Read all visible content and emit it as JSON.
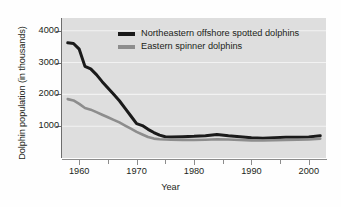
{
  "chart_data": {
    "type": "line",
    "title": "",
    "xlabel": "Year",
    "ylabel": "Dolphin population (in thousands)",
    "xlim": [
      1957,
      2003
    ],
    "ylim": [
      0,
      4400
    ],
    "grid": "horizontal-white",
    "legend_position": "inside-top-center",
    "y_ticks": [
      1000,
      2000,
      3000,
      4000
    ],
    "y_tick_labels": [
      "1000",
      "2000",
      "3000",
      "4000"
    ],
    "x_ticks": [
      1960,
      1970,
      1980,
      1990,
      2000
    ],
    "x_tick_labels": [
      "1960",
      "1970",
      "1980",
      "1990",
      "2000"
    ],
    "x_minor_ticks": [
      1965,
      1975,
      1985,
      1995
    ],
    "x": [
      1958,
      1959,
      1960,
      1961,
      1962,
      1963,
      1964,
      1965,
      1966,
      1967,
      1968,
      1969,
      1970,
      1971,
      1972,
      1973,
      1974,
      1975,
      1976,
      1978,
      1980,
      1982,
      1984,
      1986,
      1988,
      1990,
      1992,
      1994,
      1996,
      1998,
      2000,
      2002
    ],
    "series": [
      {
        "name": "Northeastern offshore spotted dolphins",
        "color": "#1a1a1a",
        "values": [
          3620,
          3600,
          3420,
          2880,
          2800,
          2620,
          2400,
          2200,
          2000,
          1800,
          1560,
          1320,
          1080,
          1020,
          900,
          800,
          720,
          670,
          660,
          670,
          680,
          700,
          740,
          700,
          670,
          640,
          620,
          640,
          650,
          650,
          660,
          700
        ]
      },
      {
        "name": "Eastern spinner dolphins",
        "color": "#8d8d8d",
        "values": [
          1850,
          1810,
          1700,
          1570,
          1520,
          1440,
          1360,
          1280,
          1200,
          1120,
          1020,
          920,
          820,
          740,
          660,
          610,
          590,
          580,
          575,
          570,
          565,
          575,
          590,
          580,
          565,
          555,
          550,
          560,
          570,
          575,
          580,
          610
        ]
      }
    ]
  },
  "legend": {
    "items": [
      {
        "label": "Northeastern offshore spotted dolphins",
        "color": "#1a1a1a"
      },
      {
        "label": "Eastern spinner dolphins",
        "color": "#8d8d8d"
      }
    ]
  },
  "axes": {
    "y_title": "Dolphin population (in thousands)",
    "x_title": "Year",
    "y_tick_labels": [
      "4000",
      "3000",
      "2000",
      "1000"
    ],
    "x_tick_labels": [
      "1960",
      "1970",
      "1980",
      "1990",
      "2000"
    ]
  },
  "colors": {
    "plot_background": "#dedede",
    "gridline": "#f2f2f2",
    "axis": "#6d6d6d",
    "text": "#231f20",
    "series_black": "#1a1a1a",
    "series_gray": "#8d8d8d"
  }
}
